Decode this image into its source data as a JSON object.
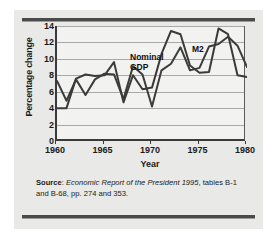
{
  "figure": {
    "source_prefix": "Source",
    "source_sep": ": ",
    "source_title": "Economic Report of the President 1995",
    "source_rest": ", tables B-1 and B-68, pp. 274 and 353."
  },
  "chart_data": {
    "type": "line",
    "title": "",
    "xlabel": "Year",
    "ylabel": "Percentage change",
    "xlim": [
      1960,
      1980
    ],
    "ylim": [
      0,
      14
    ],
    "xticks": [
      1960,
      1965,
      1970,
      1975,
      1980
    ],
    "yticks": [
      0,
      2,
      4,
      6,
      8,
      10,
      12,
      14
    ],
    "grid": "horizontal",
    "legend": "inline-annotations",
    "annotations": [
      {
        "text": "Nominal\nGDP",
        "x": 1967.2,
        "y": 11.3
      },
      {
        "text": "M2",
        "x": 1973.6,
        "y": 12.6
      }
    ],
    "x": [
      1960,
      1961,
      1962,
      1963,
      1964,
      1965,
      1966,
      1967,
      1968,
      1969,
      1970,
      1971,
      1972,
      1973,
      1974,
      1975,
      1976,
      1977,
      1978,
      1979,
      1980
    ],
    "series": [
      {
        "name": "Nominal GDP",
        "color": "#3c3c3c",
        "values": [
          7.3,
          4.9,
          7.5,
          5.6,
          7.5,
          8.2,
          8.1,
          5.1,
          9.1,
          8.1,
          4.2,
          8.6,
          9.4,
          11.4,
          8.6,
          8.9,
          11.5,
          11.8,
          12.7,
          11.6,
          9.0
        ]
      },
      {
        "name": "M2",
        "color": "#3a3a3a",
        "values": [
          4.0,
          4.0,
          7.6,
          8.1,
          7.9,
          8.0,
          9.6,
          4.7,
          8.0,
          6.3,
          6.5,
          10.6,
          13.4,
          13.0,
          9.2,
          8.3,
          8.4,
          13.7,
          13.0,
          8.0,
          7.8
        ]
      }
    ]
  }
}
